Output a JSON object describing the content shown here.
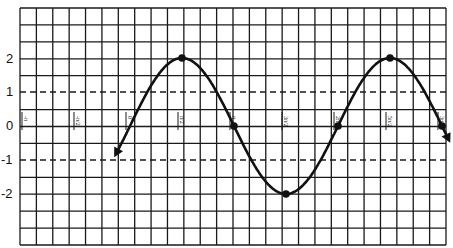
{
  "chart_data": {
    "type": "line",
    "title": "",
    "xlabel": "",
    "ylabel": "",
    "function": "y = 2 sin(x)",
    "xlim": [
      -1.15,
      3.06
    ],
    "xlim_units": "multiples of pi",
    "ylim": [
      -3.5,
      3.5
    ],
    "grid": true,
    "dashed_reference_lines": [
      1,
      -1
    ],
    "y_ticks": [
      2,
      1,
      0,
      -1,
      -2
    ],
    "y_tick_labels": [
      "2",
      "1",
      "0",
      "-1",
      "-2"
    ],
    "x_ticks": [
      "-π",
      "-π/2",
      "0",
      "π/2",
      "π",
      "3π/2",
      "2π",
      "5π/2",
      "3π"
    ],
    "x_tick_values": [
      -3.1416,
      -1.5708,
      0,
      1.5708,
      3.1416,
      4.7124,
      6.2832,
      7.854,
      9.4248
    ],
    "curve_start_x": -0.12,
    "curve_end_x": 3.06,
    "curve_endpoints": "arrows at both ends",
    "marked_points": [
      {
        "x": "π/2",
        "y": 2
      },
      {
        "x": "π",
        "y": 0
      },
      {
        "x": "3π/2",
        "y": -2
      },
      {
        "x": "2π",
        "y": 0
      },
      {
        "x": "5π/2",
        "y": 2
      },
      {
        "x": "3π",
        "y": 0
      }
    ],
    "series": [
      {
        "name": "2 sin x",
        "x": [
          -0.39,
          0,
          1.5708,
          3.1416,
          4.7124,
          6.2832,
          7.854,
          9.4248,
          9.6
        ],
        "y": [
          -0.76,
          0,
          2,
          0,
          -2,
          0,
          2,
          0,
          -0.35
        ]
      }
    ]
  },
  "axis": {
    "y_labels": [
      {
        "text": "2",
        "y": 59
      },
      {
        "text": "1",
        "y": 92
      },
      {
        "text": "0",
        "y": 126
      },
      {
        "text": "-1",
        "y": 160
      },
      {
        "text": "-2",
        "y": 194
      }
    ]
  },
  "style": {
    "grid_color": "#1a1a1a",
    "curve_color": "#111111",
    "background": "#ffffff"
  }
}
